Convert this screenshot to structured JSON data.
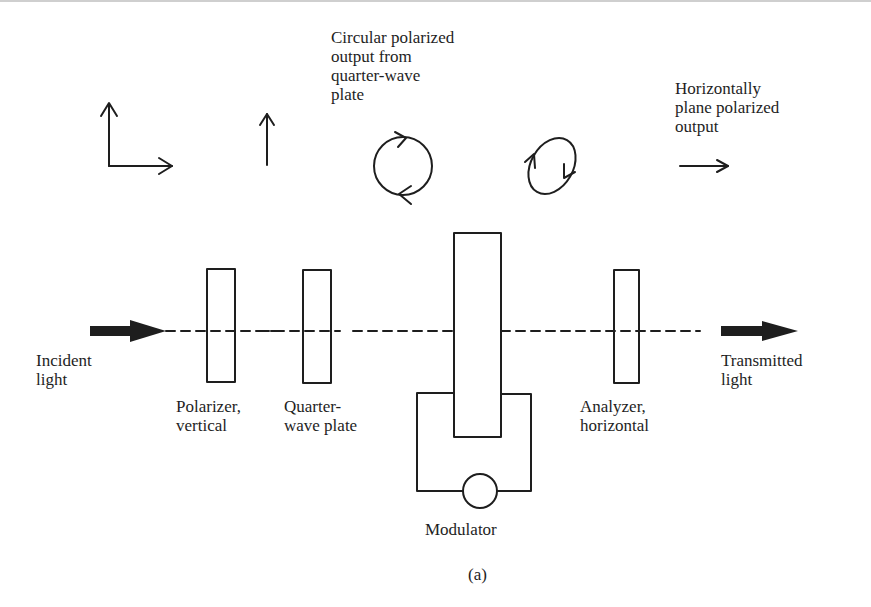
{
  "figure": {
    "caption": "(a)",
    "colors": {
      "ink": "#1e1e1e",
      "background": "#ffffff"
    }
  },
  "top_annotations": {
    "circular_output": [
      "Circular polarized",
      "output from",
      "quarter-wave",
      "plate"
    ],
    "horizontal_output": [
      "Horizontally",
      "plane polarized",
      "output"
    ]
  },
  "components": {
    "incident_light": [
      "Incident",
      "light"
    ],
    "polarizer": [
      "Polarizer,",
      "vertical"
    ],
    "quarter_wave_plate": [
      "Quarter-",
      "wave plate"
    ],
    "modulator": [
      "Modulator"
    ],
    "analyzer": [
      "Analyzer,",
      "horizontal"
    ],
    "transmitted_light": [
      "Transmitted",
      "light"
    ]
  },
  "icons": {
    "unpolarized": "two-perpendicular-arrows-icon",
    "vertical": "vertical-arrow-icon",
    "circular": "circular-polarization-icon",
    "elliptical": "elliptical-polarization-icon",
    "horizontal": "horizontal-arrow-icon"
  }
}
